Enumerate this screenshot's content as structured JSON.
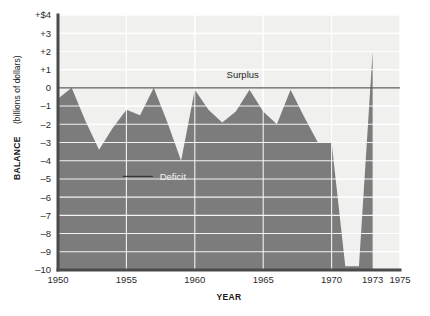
{
  "chart_data": {
    "type": "area",
    "title": "",
    "xlabel": "YEAR",
    "ylabel": "BALANCE (billions of dollars)",
    "ylabel_bold_part": "BALANCE",
    "ylabel_plain_part": "(billions of dollars)",
    "xlim": [
      1950,
      1975
    ],
    "ylim": [
      -10,
      4
    ],
    "grid": true,
    "legend": "none",
    "zero_reference_line": 0,
    "x_tick_labels": [
      "1950",
      "1955",
      "1960",
      "1965",
      "1970",
      "1973",
      "1975"
    ],
    "x_tick_values": [
      1950,
      1955,
      1960,
      1965,
      1970,
      1973,
      1975
    ],
    "y_tick_labels": [
      "+$4",
      "+3",
      "+2",
      "+1",
      "0",
      "–1",
      "–2",
      "–3",
      "–4",
      "–5",
      "–6",
      "–7",
      "–8",
      "–9",
      "–10"
    ],
    "y_tick_values": [
      4,
      3,
      2,
      1,
      0,
      -1,
      -2,
      -3,
      -4,
      -5,
      -6,
      -7,
      -8,
      -9,
      -10
    ],
    "annotations": [
      {
        "text": "Surplus",
        "x": 1963.5,
        "y": 0.55,
        "name": "surplus-label"
      },
      {
        "text": "Deficit",
        "x": 1958.4,
        "y": -5.05,
        "name": "deficit-label"
      }
    ],
    "series": [
      {
        "name": "Balance of payments",
        "x": [
          1950,
          1951,
          1952,
          1953,
          1954,
          1955,
          1956,
          1957,
          1958,
          1959,
          1960,
          1961,
          1962,
          1963,
          1964,
          1965,
          1966,
          1967,
          1968,
          1969,
          1970,
          1971,
          1972,
          1973
        ],
        "values": [
          -0.6,
          0.0,
          -1.8,
          -3.4,
          -2.2,
          -1.2,
          -1.5,
          0.0,
          -1.9,
          -4.0,
          -0.1,
          -1.2,
          -1.9,
          -1.3,
          -0.1,
          -1.3,
          -2.0,
          -0.1,
          -1.6,
          -3.0,
          -3.0,
          -9.8,
          -9.8,
          2.0
        ]
      }
    ],
    "colors": {
      "area": "#7c7c7c",
      "plot_background": "#f0f0ef",
      "gridline": "#ffffff",
      "axis": "#4a4a4a",
      "text": "#1a1a1a"
    }
  },
  "geometry": {
    "plot_left": 58,
    "plot_right": 400,
    "plot_top": 15,
    "plot_bottom": 270
  }
}
